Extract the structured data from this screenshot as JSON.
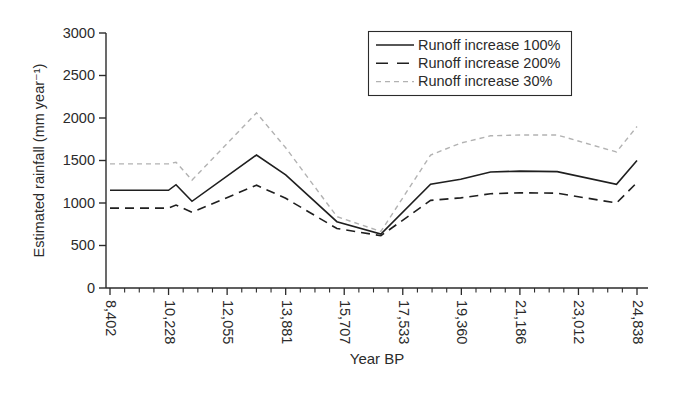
{
  "figure": {
    "background": "#ffffff",
    "text_color": "#2b2b2b",
    "axis_color": "#2b2b2b"
  },
  "chart_data": {
    "type": "line",
    "title": "",
    "xlabel": "Year BP",
    "ylabel": "Estimated rainfall (mm year⁻¹)",
    "ylim": [
      0,
      3000
    ],
    "y_ticks": [
      0,
      500,
      1000,
      1500,
      2000,
      2500,
      3000
    ],
    "x_tick_values": [
      8402,
      10228,
      12055,
      13881,
      15707,
      17533,
      19360,
      21186,
      23012,
      24838
    ],
    "x_tick_labels": [
      "8,402",
      "10,228",
      "12,055",
      "13,881",
      "15,707",
      "17,533",
      "19,360",
      "21,186",
      "23,012",
      "24,838"
    ],
    "minor_ticks_between": 3,
    "grid": false,
    "legend_position": "top-right-inside",
    "x": [
      8402,
      10228,
      10460,
      10960,
      12970,
      13881,
      15480,
      16850,
      18400,
      19340,
      20270,
      21186,
      22350,
      24200,
      24838
    ],
    "series": [
      {
        "name": "Runoff increase 100%",
        "color": "#1f1f1f",
        "dash": "",
        "width": 1.6,
        "values": [
          1150,
          1150,
          1215,
          1020,
          1565,
          1330,
          780,
          635,
          1220,
          1280,
          1365,
          1375,
          1370,
          1220,
          1500
        ]
      },
      {
        "name": "Runoff increase 200%",
        "color": "#1f1f1f",
        "dash": "9 6",
        "width": 1.6,
        "values": [
          940,
          940,
          975,
          890,
          1210,
          1055,
          700,
          615,
          1030,
          1060,
          1110,
          1120,
          1115,
          1000,
          1240
        ]
      },
      {
        "name": "Runoff increase 30%",
        "color": "#b2b2b2",
        "dash": "5 4",
        "width": 1.4,
        "values": [
          1460,
          1460,
          1480,
          1270,
          2060,
          1650,
          840,
          665,
          1565,
          1705,
          1790,
          1800,
          1800,
          1600,
          1900
        ]
      }
    ]
  }
}
